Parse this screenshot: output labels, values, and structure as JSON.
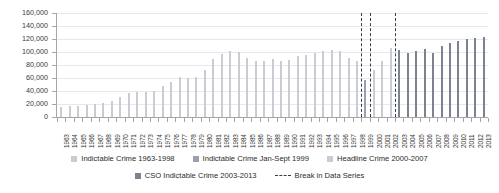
{
  "chart_data": {
    "type": "bar",
    "title": "",
    "subtitle": "",
    "xlabel": "",
    "ylabel": "",
    "ylim": [
      0,
      160000
    ],
    "ytick_step": 20000,
    "ytick_labels": [
      "0",
      "20,000",
      "40,000",
      "60,000",
      "80,000",
      "100,000",
      "120,000",
      "140,000",
      "160,000"
    ],
    "ytick_values": [
      0,
      20000,
      40000,
      60000,
      80000,
      100000,
      120000,
      140000,
      160000
    ],
    "grid": true,
    "grid_axis": "y",
    "legend_position": "bottom",
    "categories": [
      "1963",
      "1964",
      "1965",
      "1966",
      "1967",
      "1968",
      "1969",
      "1970",
      "1971",
      "1972",
      "1973",
      "1974",
      "1975",
      "1976",
      "1977",
      "1978",
      "1979",
      "1980",
      "1981",
      "1982",
      "1983",
      "1984",
      "1985",
      "1986",
      "1987",
      "1988",
      "1989",
      "1990",
      "1991",
      "1992",
      "1993",
      "1994",
      "1995",
      "1996",
      "1997",
      "1998",
      "1999",
      "2000",
      "2001",
      "2002",
      "2003",
      "2004",
      "2005",
      "2006",
      "2007",
      "2008",
      "2009",
      "2010",
      "2011",
      "2012",
      "2013"
    ],
    "series": [
      {
        "name": "Indictable Crime 1963-1998",
        "color": "#c9ccd4",
        "values": [
          15000,
          16500,
          17500,
          18000,
          19500,
          21500,
          25000,
          30500,
          37500,
          38500,
          38000,
          40000,
          47000,
          54000,
          62000,
          60500,
          62000,
          72500,
          89500,
          97000,
          102000,
          99500,
          91000,
          86000,
          85500,
          89000,
          86000,
          87500,
          94000,
          95500,
          98000,
          101000,
          102500,
          100800,
          90500,
          85500,
          null,
          null,
          null,
          null,
          null,
          null,
          null,
          null,
          null,
          null,
          null,
          null,
          null,
          null,
          null
        ]
      },
      {
        "name": "Indictable Crime Jan-Sept 1999",
        "color": "#9aa0ab",
        "values": [
          null,
          null,
          null,
          null,
          null,
          null,
          null,
          null,
          null,
          null,
          null,
          null,
          null,
          null,
          null,
          null,
          null,
          null,
          null,
          null,
          null,
          null,
          null,
          null,
          null,
          null,
          null,
          null,
          null,
          null,
          null,
          null,
          null,
          null,
          null,
          null,
          57500,
          null,
          null,
          null,
          null,
          null,
          null,
          null,
          null,
          null,
          null,
          null,
          null,
          null,
          null
        ]
      },
      {
        "name": "Headline Crime 2000-2007",
        "color": "#c9ccd4",
        "values": [
          null,
          null,
          null,
          null,
          null,
          null,
          null,
          null,
          null,
          null,
          null,
          null,
          null,
          null,
          null,
          null,
          null,
          null,
          null,
          null,
          null,
          null,
          null,
          null,
          null,
          null,
          null,
          null,
          null,
          null,
          null,
          null,
          null,
          null,
          null,
          null,
          null,
          73000,
          86500,
          106500,
          null,
          null,
          null,
          null,
          null,
          null,
          null,
          null,
          null,
          null,
          null
        ]
      },
      {
        "name": "CSO Indictable Crime 2003-2013",
        "color": "#7b8290",
        "values": [
          null,
          null,
          null,
          null,
          null,
          null,
          null,
          null,
          null,
          null,
          null,
          null,
          null,
          null,
          null,
          null,
          null,
          null,
          null,
          null,
          null,
          null,
          null,
          null,
          null,
          null,
          null,
          null,
          null,
          null,
          null,
          null,
          null,
          null,
          null,
          null,
          null,
          null,
          null,
          null,
          102500,
          99000,
          102000,
          104500,
          98500,
          110000,
          113500,
          117000,
          119500,
          121500,
          122500
        ]
      }
    ],
    "break_lines": {
      "name": "Break in Data Series",
      "color": "#3b3b4e",
      "style": "dashed",
      "after_categories": [
        "1998",
        "1999",
        "2002"
      ]
    },
    "legend": [
      {
        "label": "Indictable Crime 1963-1998",
        "color": "#c9ccd4",
        "marker": "square"
      },
      {
        "label": "Indictable Crime Jan-Sept 1999",
        "color": "#9aa0ab",
        "marker": "square"
      },
      {
        "label": "Headline Crime 2000-2007",
        "color": "#c9ccd4",
        "marker": "square"
      },
      {
        "label": "CSO Indictable Crime 2003-2013",
        "color": "#7b8290",
        "marker": "square"
      },
      {
        "label": "Break in Data Series",
        "color": "#3b3b4e",
        "marker": "dashed-line"
      }
    ],
    "colors": {
      "axis": "#a6a6a6",
      "grid": "#e8e8ec",
      "text": "#3a3a3a",
      "background": "#ffffff"
    }
  }
}
